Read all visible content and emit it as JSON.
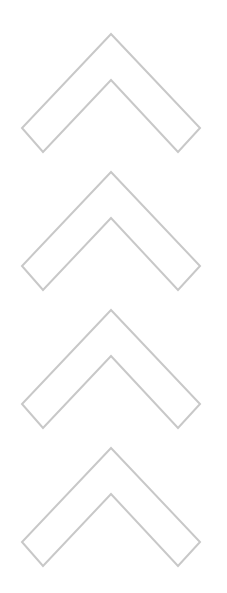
{
  "graphic": {
    "type": "stacked-chevrons",
    "direction": "up",
    "count": 4,
    "stroke_color": "#c8c8c8",
    "fill_color": "#ffffff",
    "background": "#ffffff",
    "icons": [
      {
        "name": "chevron-up-icon-1",
        "offset_y": 0
      },
      {
        "name": "chevron-up-icon-2",
        "offset_y": 138
      },
      {
        "name": "chevron-up-icon-3",
        "offset_y": 276
      },
      {
        "name": "chevron-up-icon-4",
        "offset_y": 414
      }
    ]
  }
}
